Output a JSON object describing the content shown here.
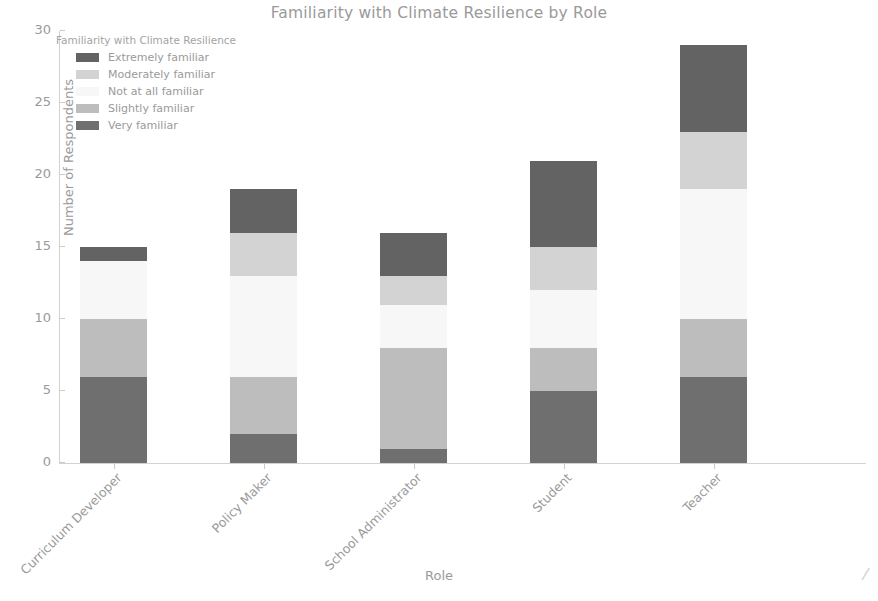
{
  "chart_data": {
    "type": "bar",
    "subtype": "stacked-bar",
    "title": "Familiarity with Climate Resilience by Role",
    "xlabel": "Role",
    "ylabel": "Number of Respondents",
    "ylim": [
      0,
      30
    ],
    "yticks": [
      0,
      5,
      10,
      15,
      20,
      25,
      30
    ],
    "grid": false,
    "legend_title": "Familiarity with Climate Resilience",
    "legend_position": "upper-left-inside",
    "categories": [
      "Curriculum Developer",
      "Policy Maker",
      "School Administrator",
      "Student",
      "Teacher"
    ],
    "stack_order_bottom_to_top": [
      "Very familiar",
      "Slightly familiar",
      "Not at all familiar",
      "Moderately familiar",
      "Extremely familiar"
    ],
    "series": [
      {
        "name": "Very familiar",
        "color": "#6f6f6f",
        "values": [
          6,
          2,
          1,
          5,
          6
        ]
      },
      {
        "name": "Slightly familiar",
        "color": "#bdbdbd",
        "values": [
          4,
          4,
          7,
          3,
          4
        ]
      },
      {
        "name": "Not at all familiar",
        "color": "#f7f7f7",
        "values": [
          4,
          7,
          3,
          4,
          9
        ]
      },
      {
        "name": "Moderately familiar",
        "color": "#d3d3d3",
        "values": [
          0,
          3,
          2,
          3,
          4
        ]
      },
      {
        "name": "Extremely familiar",
        "color": "#636363",
        "values": [
          1,
          3,
          3,
          6,
          6
        ]
      }
    ],
    "totals": [
      15,
      19,
      16,
      21,
      29
    ]
  },
  "legend": {
    "title": "Familiarity with Climate Resilience",
    "entries": [
      {
        "label": "Extremely familiar",
        "color": "#636363"
      },
      {
        "label": "Moderately familiar",
        "color": "#d3d3d3"
      },
      {
        "label": "Not at all familiar",
        "color": "#f7f7f7"
      },
      {
        "label": "Slightly familiar",
        "color": "#bdbdbd"
      },
      {
        "label": "Very familiar",
        "color": "#6f6f6f"
      }
    ]
  },
  "axes": {
    "y_tick_labels": [
      "0",
      "5",
      "10",
      "15",
      "20",
      "25",
      "30"
    ],
    "x_tick_labels": [
      "Curriculum Developer",
      "Policy Maker",
      "School Administrator",
      "Student",
      "Teacher"
    ]
  },
  "marks": {
    "corner_glyph": "/"
  }
}
